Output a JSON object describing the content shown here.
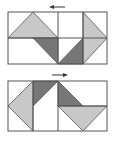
{
  "colors": {
    "background": "#ffffff",
    "frame": "#555555",
    "light": "#c8c8c8",
    "dark": "#777777",
    "arrow": "#333333"
  },
  "panels": [
    {
      "name": "top-panel",
      "arrow_direction": "left",
      "frame": {
        "x": 8,
        "y": 12,
        "w": 99,
        "h": 52
      },
      "lines": [
        [
          8,
          38,
          107,
          38
        ],
        [
          58,
          12,
          58,
          64
        ],
        [
          83,
          12,
          83,
          64
        ]
      ],
      "shapes": [
        {
          "fill": "light",
          "points": "8,38 33,12 58,38"
        },
        {
          "fill": "dark",
          "points": "33,38 58,38 58,64"
        },
        {
          "fill": "dark",
          "points": "58,64 83,38 83,64"
        },
        {
          "fill": "light",
          "points": "83,12 107,38 83,64"
        }
      ]
    },
    {
      "name": "bottom-panel",
      "arrow_direction": "right",
      "frame": {
        "x": 8,
        "y": 81,
        "w": 99,
        "h": 50
      },
      "lines": [
        [
          33,
          81,
          33,
          131
        ],
        [
          58,
          81,
          58,
          131
        ],
        [
          58,
          106,
          107,
          106
        ]
      ],
      "shapes": [
        {
          "fill": "dark",
          "points": "33,81 58,81 33,106"
        },
        {
          "fill": "light",
          "points": "33,81 8,106 33,131"
        },
        {
          "fill": "dark",
          "points": "58,81 83,106 58,106"
        },
        {
          "fill": "light",
          "points": "58,106 107,106 83,131"
        }
      ]
    }
  ]
}
